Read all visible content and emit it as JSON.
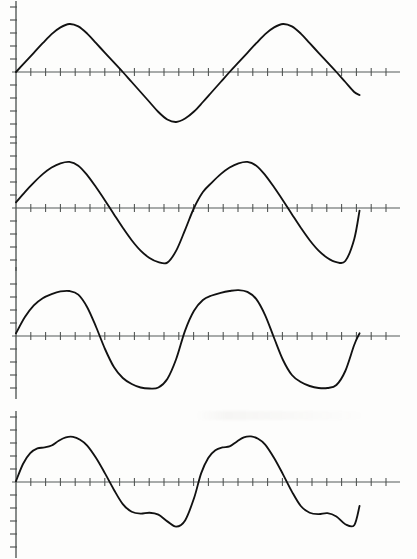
{
  "figure": {
    "kind": "scanned-waveform-figure",
    "page_background": "#fdfdfc",
    "ink_color": "#121212",
    "axis_color": "#4d514f",
    "width_px": 417,
    "height_px": 559,
    "panel_count": 4,
    "caption": ""
  },
  "chart_data": [
    {
      "type": "line",
      "title": "",
      "subtitle": "",
      "xlabel": "",
      "ylabel": "",
      "legend": [],
      "grid": false,
      "legend_position": "none",
      "waveform_name": "triangle-wave",
      "baseline_y_px": 72,
      "axis_origin_x_px": 16,
      "axis_end_x_px": 400,
      "curve_start_x_px": 16,
      "curve_end_x_px": 372,
      "cycles": 2,
      "amplitude_up_px": 48,
      "amplitude_down_px": 50,
      "y_tick_count_up": 5,
      "y_tick_count_down": 6,
      "y_tick_spacing_px": 13,
      "x_tick_spacing_px": 14.8,
      "x_tick_count": 26,
      "xlim": [
        0,
        2
      ],
      "ylim": [
        -1.05,
        1.05
      ],
      "x": [
        0,
        0.05,
        0.1,
        0.15,
        0.2,
        0.25,
        0.3,
        0.35,
        0.4,
        0.45,
        0.5,
        0.55,
        0.6,
        0.65,
        0.7,
        0.75,
        0.8,
        0.85,
        0.9,
        0.95,
        1.0,
        1.05,
        1.1,
        1.15,
        1.2,
        1.25,
        1.3,
        1.35,
        1.4,
        1.45,
        1.5,
        1.55,
        1.6,
        1.65,
        1.7,
        1.75,
        1.8,
        1.85,
        1.9,
        1.93
      ],
      "values": [
        0,
        0.2,
        0.4,
        0.6,
        0.79,
        0.93,
        1.0,
        0.95,
        0.8,
        0.6,
        0.4,
        0.2,
        0.0,
        -0.2,
        -0.4,
        -0.6,
        -0.8,
        -0.95,
        -1.0,
        -0.93,
        -0.79,
        -0.6,
        -0.4,
        -0.2,
        0.0,
        0.2,
        0.4,
        0.6,
        0.79,
        0.93,
        1.0,
        0.95,
        0.8,
        0.6,
        0.4,
        0.2,
        0.0,
        -0.2,
        -0.4,
        -0.46
      ]
    },
    {
      "type": "line",
      "title": "",
      "subtitle": "",
      "xlabel": "",
      "ylabel": "",
      "legend": [],
      "grid": false,
      "legend_position": "none",
      "waveform_name": "skewed-wave-leaning-right",
      "baseline_y_px": 208,
      "axis_origin_x_px": 16,
      "axis_end_x_px": 400,
      "curve_start_x_px": 16,
      "curve_end_x_px": 372,
      "cycles": 2,
      "amplitude_up_px": 47,
      "amplitude_down_px": 52,
      "y_tick_count_up": 5,
      "y_tick_count_down": 6,
      "y_tick_spacing_px": 13,
      "x_tick_spacing_px": 14.8,
      "x_tick_count": 26,
      "xlim": [
        0,
        2
      ],
      "ylim": [
        -1.1,
        1.05
      ],
      "x": [
        0,
        0.05,
        0.1,
        0.15,
        0.2,
        0.25,
        0.3,
        0.35,
        0.4,
        0.45,
        0.5,
        0.55,
        0.6,
        0.65,
        0.7,
        0.75,
        0.8,
        0.85,
        0.9,
        0.95,
        1.0,
        1.05,
        1.1,
        1.15,
        1.2,
        1.25,
        1.3,
        1.35,
        1.4,
        1.45,
        1.5,
        1.55,
        1.6,
        1.65,
        1.7,
        1.75,
        1.8,
        1.85,
        1.9,
        1.93
      ],
      "values": [
        0.12,
        0.34,
        0.54,
        0.72,
        0.86,
        0.95,
        0.98,
        0.9,
        0.7,
        0.44,
        0.16,
        -0.12,
        -0.38,
        -0.62,
        -0.82,
        -0.96,
        -1.04,
        -1.05,
        -0.82,
        -0.42,
        0.0,
        0.34,
        0.54,
        0.72,
        0.86,
        0.95,
        0.98,
        0.9,
        0.7,
        0.44,
        0.16,
        -0.12,
        -0.38,
        -0.62,
        -0.82,
        -0.96,
        -1.04,
        -1.02,
        -0.6,
        -0.05
      ]
    },
    {
      "type": "line",
      "title": "",
      "subtitle": "",
      "xlabel": "",
      "ylabel": "",
      "legend": [],
      "grid": false,
      "legend_position": "none",
      "waveform_name": "rounded-square-wave",
      "baseline_y_px": 336,
      "axis_origin_x_px": 16,
      "axis_end_x_px": 400,
      "curve_start_x_px": 16,
      "curve_end_x_px": 372,
      "cycles": 2,
      "amplitude_up_px": 45,
      "amplitude_down_px": 50,
      "y_tick_count_up": 4,
      "y_tick_count_down": 5,
      "y_tick_spacing_px": 13,
      "x_tick_spacing_px": 14.8,
      "x_tick_count": 26,
      "xlim": [
        0,
        2
      ],
      "ylim": [
        -1.1,
        1.05
      ],
      "x": [
        0,
        0.05,
        0.1,
        0.15,
        0.2,
        0.25,
        0.3,
        0.35,
        0.4,
        0.45,
        0.5,
        0.55,
        0.6,
        0.65,
        0.7,
        0.75,
        0.8,
        0.85,
        0.9,
        0.95,
        1.0,
        1.05,
        1.1,
        1.15,
        1.2,
        1.25,
        1.3,
        1.35,
        1.4,
        1.45,
        1.5,
        1.55,
        1.6,
        1.65,
        1.7,
        1.75,
        1.8,
        1.85,
        1.9,
        1.93
      ],
      "values": [
        0.06,
        0.42,
        0.68,
        0.84,
        0.93,
        0.99,
        1.0,
        0.92,
        0.64,
        0.2,
        -0.26,
        -0.62,
        -0.84,
        -0.96,
        -1.03,
        -1.05,
        -1.03,
        -0.86,
        -0.46,
        0.12,
        0.56,
        0.8,
        0.9,
        0.96,
        1.0,
        1.02,
        0.98,
        0.82,
        0.46,
        -0.04,
        -0.48,
        -0.78,
        -0.92,
        -1.0,
        -1.04,
        -1.04,
        -0.98,
        -0.7,
        -0.18,
        0.06
      ]
    },
    {
      "type": "line",
      "title": "",
      "subtitle": "",
      "xlabel": "",
      "ylabel": "",
      "legend": [],
      "grid": false,
      "legend_position": "none",
      "waveform_name": "complex-harmonic-wave-with-shoulders",
      "baseline_y_px": 482,
      "axis_origin_x_px": 16,
      "axis_end_x_px": 400,
      "curve_start_x_px": 16,
      "curve_end_x_px": 372,
      "cycles": 2,
      "amplitude_up_px": 48,
      "amplitude_down_px": 48,
      "y_tick_count_up": 5,
      "y_tick_count_down": 6,
      "y_tick_spacing_px": 13,
      "x_tick_spacing_px": 14.8,
      "x_tick_count": 26,
      "xlim": [
        0,
        2
      ],
      "ylim": [
        -1.05,
        1.05
      ],
      "x": [
        0,
        0.04,
        0.08,
        0.12,
        0.16,
        0.2,
        0.24,
        0.28,
        0.32,
        0.36,
        0.4,
        0.45,
        0.5,
        0.55,
        0.6,
        0.65,
        0.7,
        0.75,
        0.8,
        0.85,
        0.9,
        0.95,
        1.0,
        1.04,
        1.08,
        1.12,
        1.16,
        1.2,
        1.24,
        1.28,
        1.32,
        1.36,
        1.4,
        1.45,
        1.5,
        1.55,
        1.6,
        1.65,
        1.7,
        1.75,
        1.8,
        1.85,
        1.9,
        1.93
      ],
      "values": [
        0.02,
        0.38,
        0.6,
        0.7,
        0.72,
        0.76,
        0.86,
        0.93,
        0.94,
        0.88,
        0.76,
        0.5,
        0.18,
        -0.16,
        -0.46,
        -0.62,
        -0.66,
        -0.64,
        -0.68,
        -0.82,
        -0.93,
        -0.8,
        -0.34,
        0.18,
        0.5,
        0.66,
        0.72,
        0.74,
        0.84,
        0.93,
        0.95,
        0.9,
        0.78,
        0.5,
        0.16,
        -0.2,
        -0.5,
        -0.64,
        -0.67,
        -0.65,
        -0.72,
        -0.88,
        -0.9,
        -0.5
      ]
    }
  ]
}
